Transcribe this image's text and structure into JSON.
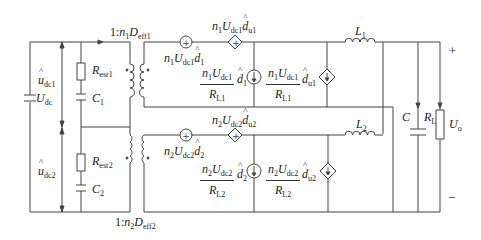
{
  "diagram": {
    "type": "circuit-schematic",
    "input": {
      "source_label": "U_dc",
      "source_text": "U",
      "source_sub": "dc",
      "upper_voltage": {
        "text": "u",
        "sub": "dc1",
        "hat": true
      },
      "lower_voltage": {
        "text": "u",
        "sub": "dc2",
        "hat": true
      }
    },
    "capacitor_branch_1": {
      "resistor": {
        "text": "R",
        "sub": "esr1"
      },
      "capacitor": {
        "text": "C",
        "sub": "1"
      }
    },
    "capacitor_branch_2": {
      "resistor": {
        "text": "R",
        "sub": "esr2"
      },
      "capacitor": {
        "text": "C",
        "sub": "2"
      }
    },
    "transformer_1": {
      "ratio_prefix": "1:",
      "n": "n",
      "n_sub": "1",
      "D": "D",
      "D_sub": "eff1"
    },
    "transformer_2": {
      "ratio_prefix": "1:",
      "n": "n",
      "n_sub": "2",
      "D": "D",
      "D_sub": "eff2"
    },
    "channel_1": {
      "voltage_source": {
        "n": "n",
        "n_sub": "1",
        "U": "U",
        "U_sub": "dc1",
        "d": "d",
        "d_sub": "1"
      },
      "dependent_voltage_source": {
        "n": "n",
        "n_sub": "1",
        "U": "U",
        "U_sub": "dc1",
        "d": "d",
        "d_sub": "u1"
      },
      "current_source": {
        "num_n": "n",
        "num_n_sub": "1",
        "num_U": "U",
        "num_U_sub": "dc1",
        "den": "R",
        "den_sub": "L1",
        "d": "d",
        "d_sub": "1"
      },
      "dependent_current_source": {
        "num_n": "n",
        "num_n_sub": "1",
        "num_U": "U",
        "num_U_sub": "dc1",
        "den": "R",
        "den_sub": "L1",
        "d": "d",
        "d_sub": "u1"
      },
      "inductor": {
        "text": "L",
        "sub": "1"
      }
    },
    "channel_2": {
      "voltage_source": {
        "n": "n",
        "n_sub": "2",
        "U": "U",
        "U_sub": "dc2",
        "d": "d",
        "d_sub": "2"
      },
      "dependent_voltage_source": {
        "n": "n",
        "n_sub": "2",
        "U": "U",
        "U_sub": "dc2",
        "d": "d",
        "d_sub": "u2"
      },
      "current_source": {
        "num_n": "n",
        "num_n_sub": "2",
        "num_U": "U",
        "num_U_sub": "dc2",
        "den": "R",
        "den_sub": "L2",
        "d": "d",
        "d_sub": "2"
      },
      "dependent_current_source": {
        "num_n": "n",
        "num_n_sub": "2",
        "num_U": "U",
        "num_U_sub": "dc2",
        "den": "R",
        "den_sub": "L2",
        "d": "d",
        "d_sub": "u2"
      },
      "inductor": {
        "text": "L",
        "sub": "2"
      }
    },
    "output": {
      "capacitor": {
        "text": "C"
      },
      "load": {
        "text": "R",
        "sub": "L"
      },
      "voltage": {
        "text": "U",
        "sub": "o"
      },
      "plus": "+",
      "minus": "–"
    },
    "colors": {
      "wire": "#444444",
      "text": "#222222",
      "background": "#ffffff"
    }
  }
}
